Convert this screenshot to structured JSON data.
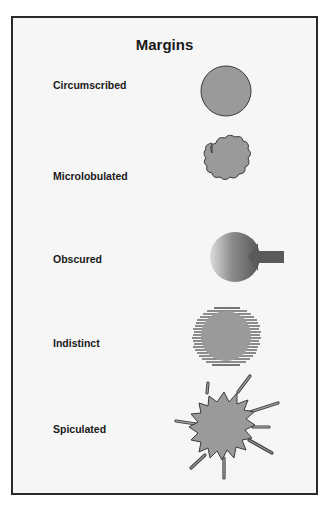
{
  "figure": {
    "title": "Margins",
    "rows": [
      {
        "label": "Circumscribed",
        "shape": "circle-smooth-icon"
      },
      {
        "label": "Microlobulated",
        "shape": "cloud-lobulated-icon"
      },
      {
        "label": "Obscured",
        "shape": "shaded-circle-with-arrow-icon"
      },
      {
        "label": "Indistinct",
        "shape": "hatched-circle-icon"
      },
      {
        "label": "Spiculated",
        "shape": "starburst-spiculated-icon"
      }
    ],
    "colors": {
      "fill": "#9a9a9a",
      "stroke": "#3a3a3a",
      "frame": "#2a2a2a",
      "background": "#f6f6f6"
    }
  }
}
